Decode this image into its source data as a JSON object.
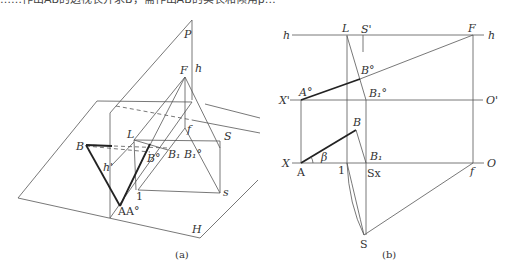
{
  "header": {
    "text": "……作出AB的透视长并求B，需作出AB的实长和倾角β…"
  },
  "figure_a": {
    "caption": "(a)",
    "labels": {
      "P": "P",
      "F": "F",
      "h_top": "h",
      "f": "f",
      "L": "L",
      "S": "S",
      "B": "B",
      "h_mid": "h'",
      "B_dd": "B°",
      "B1B1": "B₁ B₁°",
      "one": "1",
      "s": "s",
      "AA": "AA°",
      "H": "H"
    }
  },
  "figure_b": {
    "caption": "(b)",
    "labels": {
      "h_left": "h",
      "h_right": "h",
      "L": "L",
      "S_prime": "S'",
      "F": "F",
      "B_dd": "B°",
      "A_dd": "A°",
      "B1_dd": "B₁°",
      "X_prime": "X'",
      "O_prime": "O'",
      "B": "B",
      "X": "X",
      "A": "A",
      "beta": "β",
      "B1": "B₁",
      "O": "O",
      "one": "1",
      "Sx": "Sx",
      "f": "f",
      "S": "S"
    }
  }
}
